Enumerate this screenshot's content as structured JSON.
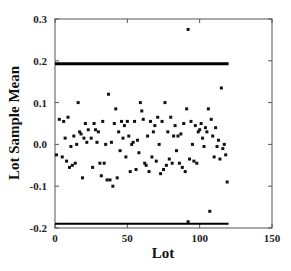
{
  "chart_data": {
    "type": "scatter",
    "title": "",
    "xlabel": "Lot",
    "ylabel": "Lot Sample Mean",
    "xlim": [
      0,
      150
    ],
    "ylim": [
      -0.2,
      0.3
    ],
    "xticks": [
      0,
      50,
      100,
      150
    ],
    "xtick_labels": [
      "0",
      "50",
      "100",
      "150"
    ],
    "yticks": [
      -0.2,
      -0.1,
      0.0,
      0.1,
      0.2,
      0.3
    ],
    "ytick_labels": [
      "-0.2",
      "-0.1",
      "0.0",
      "0.1",
      "0.2",
      "0.3"
    ],
    "grid": false,
    "legend": null,
    "control_limits": [
      {
        "name": "upper",
        "y": 0.193,
        "x_start": 0,
        "x_end": 120
      },
      {
        "name": "lower",
        "y": -0.19,
        "x_start": 0,
        "x_end": 120
      }
    ],
    "series": [
      {
        "name": "Lot sample means",
        "points": [
          [
            1,
            -0.025
          ],
          [
            3,
            0.06
          ],
          [
            5,
            -0.03
          ],
          [
            6,
            0.055
          ],
          [
            7,
            0.015
          ],
          [
            8,
            -0.04
          ],
          [
            9,
            0.065
          ],
          [
            10,
            -0.055
          ],
          [
            11,
            -0.005
          ],
          [
            12,
            -0.05
          ],
          [
            13,
            0.02
          ],
          [
            14,
            -0.045
          ],
          [
            15,
            0.0
          ],
          [
            16,
            0.1
          ],
          [
            17,
            0.03
          ],
          [
            18,
            0.025
          ],
          [
            19,
            -0.08
          ],
          [
            20,
            0.015
          ],
          [
            21,
            0.05
          ],
          [
            22,
            0.005
          ],
          [
            23,
            0.035
          ],
          [
            25,
            0.015
          ],
          [
            26,
            -0.055
          ],
          [
            27,
            0.05
          ],
          [
            28,
            0.035
          ],
          [
            29,
            0.005
          ],
          [
            30,
            0.03
          ],
          [
            31,
            -0.045
          ],
          [
            32,
            -0.075
          ],
          [
            33,
            0.055
          ],
          [
            34,
            -0.045
          ],
          [
            35,
            0.0
          ],
          [
            36,
            -0.085
          ],
          [
            37,
            0.12
          ],
          [
            38,
            -0.085
          ],
          [
            39,
            0.005
          ],
          [
            40,
            -0.1
          ],
          [
            41,
            0.05
          ],
          [
            42,
            0.085
          ],
          [
            43,
            -0.08
          ],
          [
            44,
            0.03
          ],
          [
            45,
            -0.015
          ],
          [
            46,
            0.055
          ],
          [
            47,
            0.015
          ],
          [
            48,
            0.045
          ],
          [
            49,
            -0.03
          ],
          [
            50,
            0.055
          ],
          [
            51,
            0.02
          ],
          [
            52,
            -0.065
          ],
          [
            53,
            0.0
          ],
          [
            54,
            0.005
          ],
          [
            55,
            0.055
          ],
          [
            56,
            -0.06
          ],
          [
            57,
            0.01
          ],
          [
            58,
            -0.02
          ],
          [
            59,
            0.1
          ],
          [
            60,
            0.08
          ],
          [
            61,
            0.06
          ],
          [
            62,
            -0.045
          ],
          [
            63,
            -0.05
          ],
          [
            64,
            0.02
          ],
          [
            65,
            -0.065
          ],
          [
            66,
            0.055
          ],
          [
            67,
            -0.03
          ],
          [
            68,
            0.03
          ],
          [
            69,
            0.045
          ],
          [
            70,
            -0.04
          ],
          [
            71,
            0.065
          ],
          [
            72,
            0.0
          ],
          [
            73,
            -0.07
          ],
          [
            74,
            0.055
          ],
          [
            75,
            -0.06
          ],
          [
            76,
            0.1
          ],
          [
            77,
            -0.05
          ],
          [
            78,
            0.03
          ],
          [
            79,
            -0.035
          ],
          [
            80,
            0.065
          ],
          [
            81,
            -0.045
          ],
          [
            82,
            0.02
          ],
          [
            83,
            0.045
          ],
          [
            84,
            -0.015
          ],
          [
            85,
            0.02
          ],
          [
            86,
            -0.045
          ],
          [
            87,
            0.025
          ],
          [
            88,
            -0.055
          ],
          [
            89,
            0.05
          ],
          [
            90,
            -0.065
          ],
          [
            91,
            0.085
          ],
          [
            92,
            0.275
          ],
          [
            93,
            -0.035
          ],
          [
            94,
            0.055
          ],
          [
            95,
            0.0
          ],
          [
            96,
            -0.04
          ],
          [
            97,
            0.045
          ],
          [
            98,
            -0.045
          ],
          [
            99,
            0.03
          ],
          [
            100,
            0.035
          ],
          [
            101,
            0.05
          ],
          [
            102,
            0.015
          ],
          [
            103,
            -0.005
          ],
          [
            104,
            0.04
          ],
          [
            105,
            0.03
          ],
          [
            106,
            0.085
          ],
          [
            107,
            -0.16
          ],
          [
            108,
            0.06
          ],
          [
            109,
            0.02
          ],
          [
            110,
            -0.03
          ],
          [
            111,
            0.04
          ],
          [
            112,
            -0.005
          ],
          [
            113,
            0.01
          ],
          [
            114,
            -0.035
          ],
          [
            115,
            0.135
          ],
          [
            116,
            -0.01
          ],
          [
            117,
            0.0
          ],
          [
            118,
            -0.025
          ],
          [
            119,
            -0.09
          ],
          [
            92,
            -0.185
          ]
        ]
      }
    ]
  }
}
